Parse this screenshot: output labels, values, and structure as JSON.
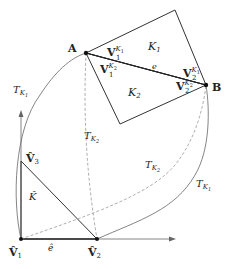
{
  "diagram": {
    "type": "finite-element-mapping",
    "points": {
      "A": {
        "label": "A",
        "x": 86,
        "y": 53
      },
      "B": {
        "label": "B",
        "x": 206,
        "y": 85
      },
      "K1_top": {
        "x": 175,
        "y": 10
      },
      "K2_bottom": {
        "x": 120,
        "y": 124
      },
      "V1_hat": {
        "label": "V̂",
        "sub": "1",
        "x": 21,
        "y": 239
      },
      "V2_hat": {
        "label": "V̂",
        "sub": "2",
        "x": 97,
        "y": 239
      },
      "V3_hat": {
        "label": "V̂",
        "sub": "3",
        "x": 21,
        "y": 161
      }
    },
    "elements": {
      "K1": {
        "label": "K",
        "sub": "1"
      },
      "K2": {
        "label": "K",
        "sub": "2"
      },
      "K_hat": {
        "label": "K̂"
      },
      "edge_e": {
        "label": "e"
      },
      "edge_e_hat": {
        "label": "ê"
      }
    },
    "vertex_labels": {
      "V1_K1": {
        "base": "V",
        "sub": "1",
        "sup": "K",
        "supsub": "1"
      },
      "V1_K2": {
        "base": "V",
        "sub": "1",
        "sup": "K",
        "supsub": "2"
      },
      "V2_K1": {
        "base": "V",
        "sub": "2",
        "sup": "K",
        "supsub": "1"
      },
      "V2_K2": {
        "base": "V",
        "sub": "2",
        "sup": "K",
        "supsub": "2"
      }
    },
    "maps": {
      "T_K1_left": {
        "label": "T",
        "sub": "K",
        "subsub": "1"
      },
      "T_K1_right": {
        "label": "T",
        "sub": "K",
        "subsub": "1"
      },
      "T_K2_mid": {
        "label": "T",
        "sub": "K",
        "subsub": "2"
      },
      "T_K2_right": {
        "label": "T",
        "sub": "K",
        "subsub": "2"
      }
    }
  }
}
